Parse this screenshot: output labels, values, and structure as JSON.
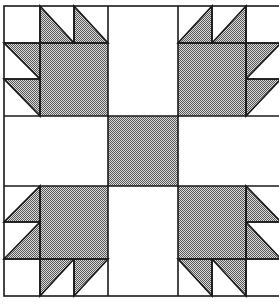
{
  "figure": {
    "canvas": {
      "width": 279,
      "height": 306
    },
    "colors": {
      "background": "#ffffff",
      "line": "#1a1a1a",
      "halftone_dark": "#5a5a5a",
      "halftone_light": "#d8d8d8"
    },
    "grid": {
      "x": [
        4,
        40,
        74,
        108,
        178,
        212,
        246,
        281
      ],
      "y": [
        6,
        43,
        79,
        116,
        186,
        222,
        259,
        296
      ]
    },
    "center_square": {
      "x": 108,
      "y": 116,
      "w": 70,
      "h": 70,
      "fill": "gray"
    },
    "paws": [
      {
        "name": "top-left-paw",
        "big_square": {
          "x": 40,
          "y": 43,
          "w": 68,
          "h": 73
        },
        "corner_square": {
          "x": 4,
          "y": 6,
          "w": 36,
          "h": 37
        },
        "triangles": [
          {
            "points": "40,6 40,43 74,43"
          },
          {
            "points": "74,6 74,43 108,43"
          },
          {
            "points": "4,43 40,43 40,79"
          },
          {
            "points": "4,79 40,79 40,116"
          }
        ]
      },
      {
        "name": "top-right-paw",
        "big_square": {
          "x": 178,
          "y": 43,
          "w": 68,
          "h": 73
        },
        "corner_square": {
          "x": 246,
          "y": 6,
          "w": 35,
          "h": 37
        },
        "triangles": [
          {
            "points": "178,43 212,6 212,43"
          },
          {
            "points": "212,43 246,6 246,43"
          },
          {
            "points": "246,43 281,43 246,79"
          },
          {
            "points": "246,79 281,79 246,116"
          }
        ]
      },
      {
        "name": "bottom-left-paw",
        "big_square": {
          "x": 40,
          "y": 186,
          "w": 68,
          "h": 73
        },
        "corner_square": {
          "x": 4,
          "y": 259,
          "w": 36,
          "h": 37
        },
        "triangles": [
          {
            "points": "4,222 40,186 40,222"
          },
          {
            "points": "4,259 40,222 40,259"
          },
          {
            "points": "40,259 74,259 40,296"
          },
          {
            "points": "74,259 108,259 74,296"
          }
        ]
      },
      {
        "name": "bottom-right-paw",
        "big_square": {
          "x": 178,
          "y": 186,
          "w": 68,
          "h": 73
        },
        "corner_square": {
          "x": 246,
          "y": 259,
          "w": 35,
          "h": 37
        },
        "triangles": [
          {
            "points": "246,186 246,222 281,222"
          },
          {
            "points": "246,222 246,259 281,259"
          },
          {
            "points": "178,259 212,259 212,296"
          },
          {
            "points": "212,259 246,259 246,296"
          }
        ]
      }
    ],
    "sashing": [
      {
        "name": "sash-top",
        "x": 108,
        "y": 6,
        "w": 70,
        "h": 110
      },
      {
        "name": "sash-bottom",
        "x": 108,
        "y": 186,
        "w": 70,
        "h": 110
      },
      {
        "name": "sash-left",
        "x": 4,
        "y": 116,
        "w": 104,
        "h": 70
      },
      {
        "name": "sash-right",
        "x": 178,
        "y": 116,
        "w": 103,
        "h": 70
      }
    ]
  }
}
